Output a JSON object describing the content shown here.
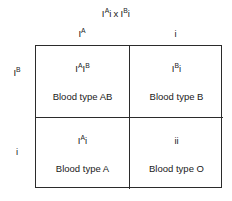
{
  "diagram": {
    "type": "punnett-square",
    "title_parts": {
      "parent1_base": "I",
      "parent1_sup": "A",
      "parent1_tail": "i",
      "operator": "x",
      "parent2_base": "I",
      "parent2_sup": "B",
      "parent2_tail": "i"
    },
    "title_plain": "IA i x IB i",
    "colors": {
      "background": "#ffffff",
      "line": "#2b2b2b",
      "text": "#1a1a1a"
    },
    "column_headers": [
      {
        "base": "I",
        "sup": "A",
        "tail": "",
        "plain": "IA"
      },
      {
        "base": "",
        "sup": "",
        "tail": "i",
        "plain": "i"
      }
    ],
    "row_headers": [
      {
        "base": "I",
        "sup": "B",
        "tail": "",
        "plain": "IB"
      },
      {
        "base": "",
        "sup": "",
        "tail": "i",
        "plain": "i"
      }
    ],
    "cells": [
      {
        "position": "top-left",
        "genotype": {
          "base1": "I",
          "sup1": "A",
          "base2": "I",
          "sup2": "B",
          "tail": "",
          "plain": "IAIB"
        },
        "phenotype": "Blood type AB"
      },
      {
        "position": "top-right",
        "genotype": {
          "base1": "I",
          "sup1": "B",
          "base2": "",
          "sup2": "",
          "tail": "i",
          "plain": "IBi"
        },
        "phenotype": "Blood type B"
      },
      {
        "position": "bottom-left",
        "genotype": {
          "base1": "I",
          "sup1": "A",
          "base2": "",
          "sup2": "",
          "tail": "i",
          "plain": "IAi"
        },
        "phenotype": "Blood type A"
      },
      {
        "position": "bottom-right",
        "genotype": {
          "base1": "",
          "sup1": "",
          "base2": "",
          "sup2": "",
          "tail": "ii",
          "plain": "ii"
        },
        "phenotype": "Blood type O"
      }
    ]
  }
}
